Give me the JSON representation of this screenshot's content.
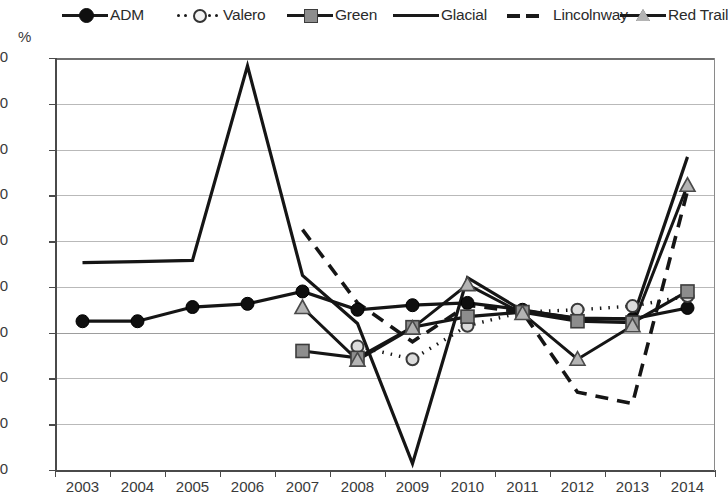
{
  "axis_unit_label": "%",
  "legend": {
    "position": "top",
    "items": [
      {
        "name": "ADM",
        "marker": "circle-filled",
        "line": "solid",
        "label": "ADM"
      },
      {
        "name": "Valero",
        "marker": "circle-open",
        "line": "dotted",
        "label": "Valero"
      },
      {
        "name": "Green",
        "marker": "square",
        "line": "solid",
        "label": "Green"
      },
      {
        "name": "Glacial",
        "marker": "none",
        "line": "solid",
        "label": "Glacial"
      },
      {
        "name": "Lincolnway",
        "marker": "none",
        "line": "dashed",
        "label": "Lincolnway"
      },
      {
        "name": "Red Trail",
        "marker": "triangle",
        "line": "solid",
        "label": "Red Trail"
      }
    ]
  },
  "chart_data": {
    "type": "line",
    "title": "",
    "xlabel": "",
    "ylabel": "%",
    "categories": [
      "2003",
      "2004",
      "2005",
      "2006",
      "2007",
      "2008",
      "2009",
      "2010",
      "2011",
      "2012",
      "2013",
      "2014"
    ],
    "ylim": [
      -30,
      60
    ],
    "ytick_labels": [
      "60",
      "50",
      "40",
      "30",
      "20",
      "10",
      "0",
      "-10",
      "-20",
      "-30"
    ],
    "yticks": [
      60,
      50,
      40,
      30,
      20,
      10,
      0,
      -10,
      -20,
      -30
    ],
    "grid": true,
    "legend_position": "top",
    "series": [
      {
        "name": "ADM",
        "values": [
          2.5,
          2.5,
          5.6,
          6.3,
          9.0,
          5.0,
          6.0,
          6.5,
          5.0,
          3.0,
          3.0,
          5.4
        ]
      },
      {
        "name": "Valero",
        "values": [
          null,
          null,
          null,
          null,
          null,
          -3.0,
          -5.8,
          1.5,
          4.5,
          5.0,
          5.8,
          8.0
        ]
      },
      {
        "name": "Green",
        "values": [
          null,
          null,
          null,
          null,
          -4.0,
          -5.5,
          1.2,
          3.5,
          4.5,
          2.5,
          2.2,
          9.0
        ]
      },
      {
        "name": "Glacial",
        "values": [
          15.3,
          15.5,
          15.8,
          58.3,
          12.5,
          2.0,
          -28.6,
          12.0,
          4.8,
          3.2,
          3.0,
          38.4
        ]
      },
      {
        "name": "Lincolnway",
        "values": [
          null,
          null,
          null,
          null,
          22.5,
          6.5,
          -2.0,
          6.0,
          4.5,
          -13.0,
          -15.5,
          31.0
        ]
      },
      {
        "name": "Red Trail",
        "values": [
          null,
          null,
          null,
          null,
          5.5,
          -6.0,
          1.0,
          10.5,
          4.2,
          -5.8,
          1.5,
          32.2
        ]
      }
    ],
    "colors": {
      "line": "#151515",
      "grid": "#b9b9b9",
      "axis": "#4a4a4a",
      "marker_filled": "#0f0f0f",
      "marker_open": "#f2f2f2",
      "marker_square": "#8d8d8d",
      "marker_triangle": "#b4b4b4",
      "text": "#3a3a3a",
      "background": "#ffffff"
    }
  }
}
